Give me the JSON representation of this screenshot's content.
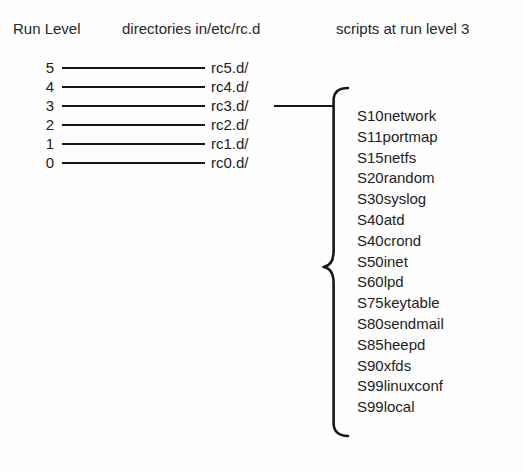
{
  "headers": {
    "run_level": "Run Level",
    "directories": "directories in/etc/rc.d",
    "scripts": "scripts at run level 3"
  },
  "levels": [
    {
      "level": "5",
      "directory": "rc5.d/"
    },
    {
      "level": "4",
      "directory": "rc4.d/"
    },
    {
      "level": "3",
      "directory": "rc3.d/"
    },
    {
      "level": "2",
      "directory": "rc2.d/"
    },
    {
      "level": "1",
      "directory": "rc1.d/"
    },
    {
      "level": "0",
      "directory": "rc0.d/"
    }
  ],
  "highlighted_level": "3",
  "scripts": [
    "S10network",
    "S11portmap",
    "S15netfs",
    "S20random",
    "S30syslog",
    "S40atd",
    "S40crond",
    "S50inet",
    "S60lpd",
    "S75keytable",
    "S80sendmail",
    "S85heepd",
    "S90xfds",
    "S99linuxconf",
    "S99local"
  ],
  "colors": {
    "background": "#fefefe",
    "ink": "#1d1d1d",
    "rule": "#171717"
  }
}
